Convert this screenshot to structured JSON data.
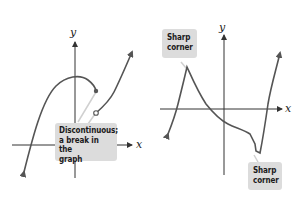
{
  "panels": [
    {
      "id": "left",
      "axes": {
        "x_label": "x",
        "y_label": "y"
      },
      "callout": {
        "lines": [
          "Discontinuous;",
          "a break in the",
          "graph"
        ]
      }
    },
    {
      "id": "right",
      "axes": {
        "x_label": "x",
        "y_label": "y"
      },
      "callouts": [
        {
          "lines": [
            "Sharp",
            "corner"
          ]
        },
        {
          "lines": [
            "Sharp",
            "corner"
          ]
        }
      ]
    }
  ],
  "colors": {
    "curve": "#555555",
    "axis": "#333333",
    "callout_bg": "#dcdcdc",
    "leader": "#d0d0d0"
  }
}
